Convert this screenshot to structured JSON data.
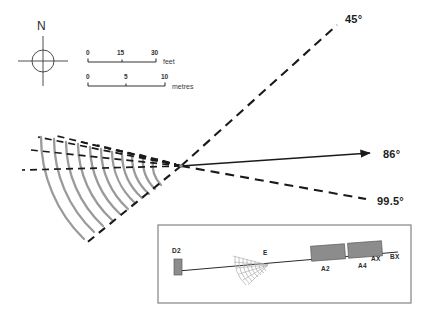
{
  "figure": {
    "type": "archaeological-site-plan",
    "background_color": "#ffffff"
  },
  "compass": {
    "north_label": "N",
    "icon": "compass-rose-icon",
    "center_x": 43,
    "center_y": 61,
    "radius": 11
  },
  "scales": [
    {
      "unit_label": "feet",
      "ticks": [
        "0",
        "15",
        "30"
      ],
      "bar_x": 88,
      "bar_y": 62,
      "bar_width": 68
    },
    {
      "unit_label": "metres",
      "ticks": [
        "0",
        "5",
        "10"
      ],
      "bar_x": 88,
      "bar_y": 86,
      "bar_width": 77
    }
  ],
  "rays": [
    {
      "name": "ray-45",
      "label": "45°",
      "style": "dashed",
      "arrow": false,
      "label_x": 345,
      "label_y": 14
    },
    {
      "name": "ray-86",
      "label": "86°",
      "style": "solid",
      "arrow": true,
      "label_x": 383,
      "label_y": 149
    },
    {
      "name": "ray-99-5",
      "label": "99.5°",
      "style": "dashed",
      "arrow": false,
      "label_x": 377,
      "label_y": 196
    }
  ],
  "apex": {
    "name": "convergence-point",
    "x": 181,
    "y": 166
  },
  "fan": {
    "name": "arc-fan",
    "arc_count": 11,
    "arc_color": "#9a9a9a",
    "radial_style": "dashed",
    "radial_color": "#1a1a1a"
  },
  "inset": {
    "name": "inset-detail-panel",
    "border_color": "#8d8d8d",
    "x": 158,
    "y": 225,
    "width": 253,
    "height": 78,
    "features": [
      {
        "name": "feature-d2",
        "label": "D2",
        "kind": "block",
        "fill": "#8c8c8c"
      },
      {
        "name": "feature-e",
        "label": "E",
        "kind": "fan-apex"
      },
      {
        "name": "feature-a2",
        "label": "A2",
        "kind": "block",
        "fill": "#8c8c8c"
      },
      {
        "name": "feature-a4",
        "label": "A4",
        "kind": "block",
        "fill": "#8c8c8c"
      },
      {
        "name": "feature-ax",
        "label": "AX",
        "kind": "point"
      },
      {
        "name": "feature-bx",
        "label": "BX",
        "kind": "point"
      }
    ]
  }
}
